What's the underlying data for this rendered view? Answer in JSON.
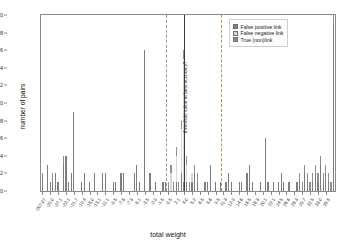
{
  "chart_data": {
    "type": "bar",
    "title": "",
    "xlabel": "total weight",
    "ylabel": "number of pairs",
    "ylim": [
      0,
      20
    ],
    "ytick_values": [
      0,
      2,
      4,
      6,
      8,
      10,
      12,
      14,
      16,
      18,
      20
    ],
    "grid": false,
    "stacked": true,
    "legend_position": "top-right",
    "legend": [
      {
        "label": "False positive link",
        "color": "#7d7d7d",
        "key": "false_positive"
      },
      {
        "label": "False negative link",
        "color": "#d8d8d8",
        "key": "false_negative"
      },
      {
        "label": "True (non)link",
        "color": "#8f8f8f",
        "key": "true_nonlink"
      }
    ],
    "annotations": [
      {
        "text": "threshold value at best accuracy?",
        "x_index": 54,
        "orientation": "vertical"
      }
    ],
    "xtick_labels": [
      "-207.07",
      "-29.0",
      "-27.1",
      "-22.1",
      "-21.7",
      "-19.4",
      "-18.0",
      "-13.1",
      "-11.1",
      "-9.5",
      "-7.8",
      "-7.3",
      "-5.1",
      "-3.5",
      "-2.9",
      "-1.5",
      "0.5",
      "2.1",
      "4.0",
      "5.2",
      "6.5",
      "8.6",
      "9.5",
      "11.3",
      "12.9",
      "14.6",
      "16.5",
      "18.3",
      "20.1",
      "22.1",
      "24.5",
      "26.8",
      "28.3",
      "29.7",
      "31.5",
      "33.0",
      "35.5"
    ],
    "xtick_indices": [
      0,
      3,
      6,
      9,
      12,
      15,
      18,
      21,
      24,
      27,
      30,
      33,
      36,
      39,
      42,
      45,
      48,
      51,
      54,
      57,
      60,
      63,
      66,
      69,
      72,
      75,
      78,
      81,
      84,
      87,
      90,
      93,
      96,
      99,
      102,
      105,
      108
    ],
    "markers": [
      {
        "type": "dashed",
        "x_index": 47,
        "color": "#b4906f"
      },
      {
        "type": "dashed",
        "x_index": 68,
        "color": "#b4906f"
      },
      {
        "type": "solid",
        "x_index": 54,
        "color": "#3a3a3a"
      }
    ],
    "n_categories": 112,
    "series": [
      {
        "name": "False positive link",
        "values": [
          2,
          0,
          3,
          1,
          1,
          2,
          1,
          0,
          3,
          4,
          1,
          2,
          9,
          0,
          0,
          1,
          2,
          0,
          1,
          0,
          2,
          0,
          0,
          2,
          2,
          0,
          0,
          1,
          1,
          0,
          2,
          2,
          0,
          0,
          0,
          2,
          3,
          1,
          0,
          16,
          0,
          2,
          0,
          1,
          0,
          0,
          1,
          1,
          0,
          0,
          0,
          1,
          0,
          2,
          1,
          1,
          0,
          1,
          2,
          1,
          0,
          0,
          1,
          1,
          3,
          0,
          1,
          0,
          1,
          0,
          1,
          2,
          1,
          0,
          0,
          1,
          1,
          0,
          2,
          3,
          1,
          0,
          0,
          1,
          0,
          6,
          1,
          0,
          1,
          0,
          1,
          2,
          1,
          0,
          1,
          0,
          0,
          1,
          1,
          0,
          2,
          1,
          0,
          1,
          2,
          1,
          3,
          1,
          2,
          1,
          0,
          19
        ]
      },
      {
        "name": "False negative link",
        "values": [
          0,
          0,
          0,
          0,
          0,
          0,
          0,
          0,
          0,
          0,
          0,
          0,
          0,
          0,
          0,
          0,
          0,
          0,
          0,
          0,
          0,
          0,
          0,
          0,
          0,
          0,
          0,
          0,
          0,
          0,
          0,
          0,
          0,
          0,
          0,
          0,
          0,
          0,
          0,
          0,
          0,
          0,
          0,
          0,
          0,
          0,
          0,
          0,
          0,
          2,
          0,
          3,
          0,
          5,
          14,
          2,
          0,
          1,
          0,
          0,
          0,
          0,
          0,
          0,
          0,
          0,
          0,
          0,
          0,
          0,
          0,
          0,
          0,
          0,
          0,
          0,
          0,
          0,
          0,
          0,
          0,
          0,
          0,
          0,
          0,
          0,
          0,
          0,
          0,
          0,
          0,
          0,
          0,
          0,
          0,
          0,
          0,
          0,
          0,
          0,
          0,
          0,
          0,
          0,
          0,
          0,
          0,
          0,
          0,
          0,
          0,
          0
        ]
      },
      {
        "name": "True (non)link",
        "values": [
          0,
          0,
          0,
          0,
          1,
          0,
          0,
          0,
          1,
          0,
          0,
          0,
          0,
          0,
          0,
          0,
          0,
          0,
          0,
          0,
          0,
          0,
          0,
          0,
          0,
          0,
          0,
          0,
          0,
          0,
          0,
          0,
          0,
          0,
          0,
          0,
          0,
          0,
          0,
          0,
          0,
          0,
          0,
          0,
          0,
          0,
          0,
          0,
          1,
          1,
          1,
          1,
          1,
          1,
          1,
          1,
          1,
          0,
          1,
          1,
          0,
          0,
          0,
          0,
          0,
          0,
          0,
          0,
          0,
          0,
          0,
          0,
          0,
          0,
          0,
          0,
          0,
          0,
          0,
          0,
          0,
          0,
          0,
          0,
          0,
          0,
          0,
          0,
          0,
          0,
          0,
          0,
          0,
          0,
          0,
          0,
          0,
          0,
          1,
          1,
          1,
          1,
          1,
          1,
          1,
          1,
          1,
          1,
          1,
          1,
          1,
          1
        ]
      }
    ]
  },
  "axes": {
    "ylabel": "number of pairs",
    "xlabel": "total weight"
  }
}
